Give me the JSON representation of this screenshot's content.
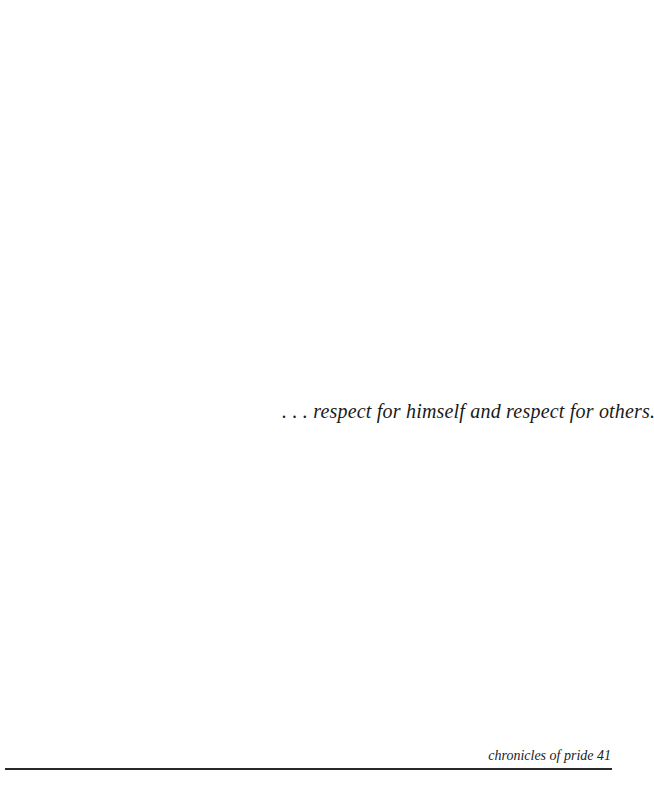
{
  "page": {
    "quote": ". . . respect for himself and respect for others.",
    "footer": {
      "running_title": "chronicles of pride 41"
    }
  }
}
